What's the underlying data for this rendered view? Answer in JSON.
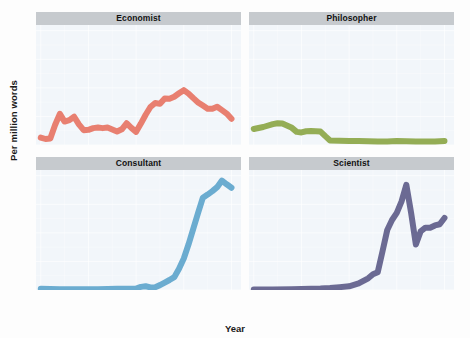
{
  "figure": {
    "xlabel": "Year",
    "ylabel": "Per million words"
  },
  "chart_data": {
    "type": "line",
    "title": "",
    "xlabel": "Year",
    "ylabel": "Per million words",
    "xlim": [
      1795,
      2010
    ],
    "ylim": [
      0,
      42
    ],
    "yticks": [
      0,
      10,
      20,
      30,
      40
    ],
    "xticks": [
      1800,
      1850,
      1900,
      1950,
      2000
    ],
    "xtick_labels": [
      "1800",
      "1850",
      "1900",
      "1950",
      "2000"
    ],
    "ytick_labels": [
      "0",
      "10",
      "20",
      "30",
      "40"
    ],
    "grid": true,
    "legend": "none",
    "facet_layout": "2x2",
    "panels": [
      {
        "title": "Economist",
        "color": "#e87f70",
        "x": [
          1800,
          1805,
          1810,
          1815,
          1820,
          1825,
          1830,
          1835,
          1840,
          1845,
          1850,
          1855,
          1860,
          1865,
          1870,
          1875,
          1880,
          1885,
          1890,
          1895,
          1900,
          1905,
          1910,
          1915,
          1920,
          1925,
          1930,
          1935,
          1940,
          1945,
          1950,
          1955,
          1960,
          1965,
          1970,
          1975,
          1980,
          1985,
          1990,
          1995,
          2000
        ],
        "y": [
          2.6,
          2.1,
          2.3,
          7.0,
          10.9,
          8.2,
          8.7,
          9.9,
          7.2,
          5.2,
          5.3,
          5.9,
          6.1,
          5.9,
          6.1,
          5.4,
          4.7,
          5.5,
          7.6,
          6.0,
          4.6,
          7.5,
          10.6,
          13.3,
          14.7,
          14.4,
          16.3,
          16.2,
          16.9,
          18.1,
          19.2,
          18.0,
          16.4,
          14.9,
          13.8,
          12.7,
          12.7,
          13.4,
          12.2,
          11.0,
          9.2
        ]
      },
      {
        "title": "Philosopher",
        "color": "#94ad55",
        "x": [
          1800,
          1810,
          1820,
          1825,
          1830,
          1840,
          1845,
          1850,
          1855,
          1860,
          1865,
          1870,
          1875,
          1880,
          1890,
          1900,
          1910,
          1920,
          1930,
          1940,
          1950,
          1960,
          1970,
          1980,
          1990,
          2000
        ],
        "y": [
          5.6,
          6.3,
          7.3,
          7.6,
          7.5,
          6.0,
          4.6,
          4.4,
          4.8,
          4.9,
          4.8,
          4.7,
          3.1,
          1.6,
          1.5,
          1.4,
          1.4,
          1.3,
          1.2,
          1.2,
          1.4,
          1.3,
          1.2,
          1.2,
          1.2,
          1.4
        ]
      },
      {
        "title": "Consultant",
        "color": "#6bacd0",
        "x": [
          1800,
          1820,
          1840,
          1860,
          1880,
          1890,
          1900,
          1905,
          1910,
          1915,
          1920,
          1925,
          1930,
          1935,
          1940,
          1945,
          1950,
          1955,
          1960,
          1965,
          1970,
          1975,
          1980,
          1985,
          1990,
          1995,
          2000
        ],
        "y": [
          0.4,
          0.3,
          0.3,
          0.3,
          0.4,
          0.4,
          0.5,
          1.1,
          1.3,
          0.9,
          1.0,
          1.7,
          2.6,
          3.5,
          4.5,
          7.4,
          11.0,
          16.0,
          21.5,
          27.0,
          32.3,
          33.4,
          34.6,
          36.0,
          38.3,
          37.0,
          35.8
        ]
      },
      {
        "title": "Scientist",
        "color": "#6b6a93",
        "x": [
          1800,
          1820,
          1840,
          1860,
          1870,
          1880,
          1890,
          1900,
          1910,
          1920,
          1925,
          1930,
          1935,
          1940,
          1945,
          1950,
          1955,
          1960,
          1965,
          1970,
          1975,
          1980,
          1985,
          1990,
          1995,
          2000
        ],
        "y": [
          0.2,
          0.2,
          0.3,
          0.4,
          0.5,
          0.7,
          1.0,
          1.3,
          2.3,
          4.1,
          5.5,
          6.2,
          13.5,
          21.0,
          24.5,
          27.0,
          31.0,
          36.8,
          27.0,
          15.9,
          20.5,
          21.8,
          21.8,
          22.6,
          23.0,
          25.2
        ]
      }
    ]
  }
}
